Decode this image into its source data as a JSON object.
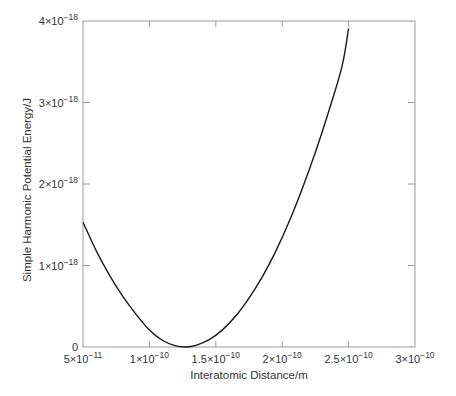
{
  "chart_data": {
    "type": "line",
    "title": "",
    "xlabel": "Interatomic Distance/m",
    "ylabel": "Simple Harmonic Potential Energy/J",
    "xlim": [
      5e-11,
      3e-10
    ],
    "ylim": [
      0,
      4e-18
    ],
    "grid": false,
    "legend": null,
    "x_ticks": [
      {
        "value": 5e-11,
        "mantissa": "5",
        "exp": "−11"
      },
      {
        "value": 1e-10,
        "mantissa": "1",
        "exp": "−10"
      },
      {
        "value": 1.5e-10,
        "mantissa": "1.5",
        "exp": "−10"
      },
      {
        "value": 2e-10,
        "mantissa": "2",
        "exp": "−10"
      },
      {
        "value": 2.5e-10,
        "mantissa": "2.5",
        "exp": "−10"
      },
      {
        "value": 3e-10,
        "mantissa": "3",
        "exp": "−10"
      }
    ],
    "y_ticks": [
      {
        "value": 0,
        "mantissa": "0",
        "exp": ""
      },
      {
        "value": 1e-18,
        "mantissa": "1",
        "exp": "−18"
      },
      {
        "value": 2e-18,
        "mantissa": "2",
        "exp": "−18"
      },
      {
        "value": 3e-18,
        "mantissa": "3",
        "exp": "−18"
      },
      {
        "value": 4e-18,
        "mantissa": "4",
        "exp": "−18"
      }
    ],
    "series": [
      {
        "name": "Simple harmonic potential",
        "color": "#1a1a1a",
        "x": [
          5e-11,
          6e-11,
          7e-11,
          8e-11,
          9e-11,
          1e-10,
          1.1e-10,
          1.2e-10,
          1.27e-10,
          1.35e-10,
          1.45e-10,
          1.55e-10,
          1.65e-10,
          1.75e-10,
          1.85e-10,
          1.95e-10,
          2.05e-10,
          2.15e-10,
          2.25e-10,
          2.35e-10,
          2.45e-10,
          2.5e-10
        ],
        "y": [
          1.53e-18,
          1.18e-18,
          8.8e-19,
          6.2e-19,
          4e-19,
          2.1e-19,
          8e-20,
          1.3e-20,
          0.0,
          2e-20,
          9e-20,
          2.1e-19,
          3.8e-19,
          6e-19,
          8.6e-19,
          1.17e-18,
          1.53e-18,
          1.94e-18,
          2.39e-18,
          2.89e-18,
          3.44e-18,
          3.91e-18
        ]
      }
    ]
  },
  "colors": {
    "frame": "#9a9a9a",
    "curve": "#1a1a1a",
    "text": "#333333"
  }
}
